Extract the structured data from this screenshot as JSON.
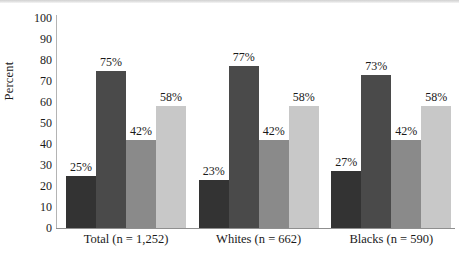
{
  "chart_data": {
    "type": "bar",
    "title": "",
    "xlabel": "",
    "ylabel": "Percent",
    "ylim": [
      0,
      100
    ],
    "yticks": [
      100,
      90,
      80,
      70,
      60,
      50,
      40,
      30,
      20,
      10,
      0
    ],
    "grid": false,
    "legend": "none",
    "value_suffix": "%",
    "categories": [
      "Total (n = 1,252)",
      "Whites (n = 662)",
      "Blacks (n = 590)"
    ],
    "series": [
      {
        "name": "series-1",
        "color": "#333333",
        "values": [
          25,
          23,
          27
        ]
      },
      {
        "name": "series-2",
        "color": "#4a4a4a",
        "values": [
          75,
          77,
          73
        ]
      },
      {
        "name": "series-3",
        "color": "#8a8a8a",
        "values": [
          42,
          42,
          42
        ]
      },
      {
        "name": "series-4",
        "color": "#c8c8c8",
        "values": [
          58,
          58,
          58
        ]
      }
    ],
    "value_labels": [
      [
        "25%",
        "75%",
        "42%",
        "58%"
      ],
      [
        "23%",
        "77%",
        "42%",
        "58%"
      ],
      [
        "27%",
        "73%",
        "42%",
        "58%"
      ]
    ]
  }
}
